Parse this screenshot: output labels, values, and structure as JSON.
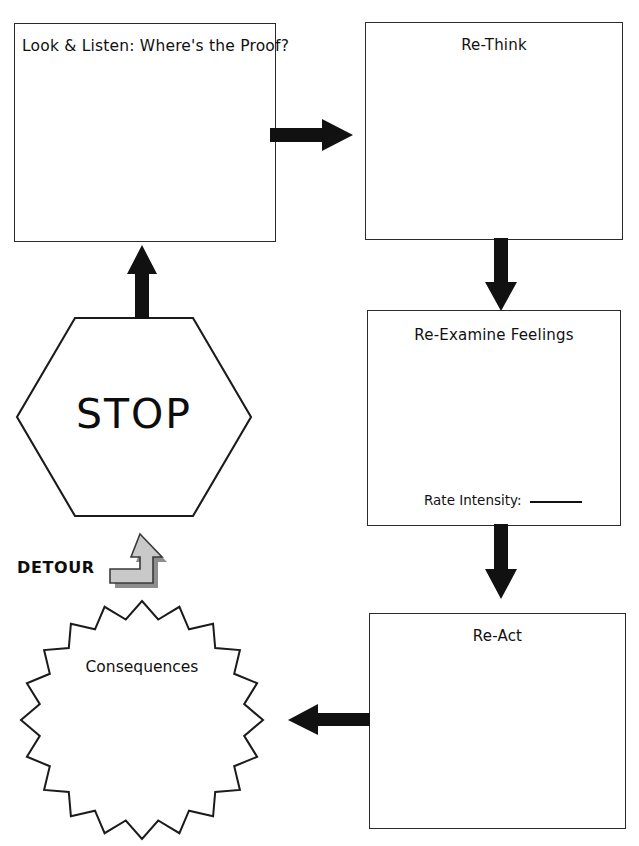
{
  "worksheet": {
    "title": "STOP Detour Thinking Worksheet",
    "width": 639,
    "height": 846,
    "background_color": "#ffffff",
    "ink_color": "#111111"
  },
  "boxes": [
    {
      "id": "look-listen",
      "label": "Look & Listen: Where's the Proof?",
      "align": "left"
    },
    {
      "id": "re-think",
      "label": "Re-Think",
      "align": "center"
    },
    {
      "id": "re-examine-feelings",
      "label": "Re-Examine Feelings",
      "align": "center"
    },
    {
      "id": "re-act",
      "label": "Re-Act",
      "align": "center"
    }
  ],
  "feelings_box": {
    "rate_label": "Rate Intensity:",
    "rate_value": ""
  },
  "stop_sign": {
    "label": "STOP",
    "shape": "hexagon"
  },
  "detour": {
    "label": "DETOUR",
    "icon": "detour-up-arrow-icon",
    "fill_color": "#c9c9c9",
    "outline_color": "#3a3a3a"
  },
  "consequences": {
    "label": "Consequences",
    "shape": "starburst",
    "points": 20
  },
  "arrows": [
    {
      "id": "look-to-rethink",
      "direction": "right",
      "from": "look-listen",
      "to": "re-think"
    },
    {
      "id": "rethink-to-feelings",
      "direction": "down",
      "from": "re-think",
      "to": "re-examine-feelings"
    },
    {
      "id": "feelings-to-react",
      "direction": "down",
      "from": "re-examine-feelings",
      "to": "re-act"
    },
    {
      "id": "react-to-consequences",
      "direction": "left",
      "from": "re-act",
      "to": "consequences"
    },
    {
      "id": "stop-to-look",
      "direction": "up",
      "from": "stop-sign",
      "to": "look-listen"
    }
  ]
}
